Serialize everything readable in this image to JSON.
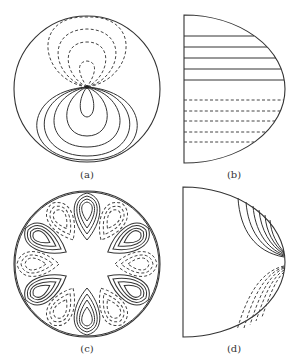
{
  "figure": {
    "panels": [
      {
        "id": "a",
        "caption": "(a)",
        "shape": "full-disk",
        "description": "dipole-like contours: dashed loops above a singular point, solid loops below"
      },
      {
        "id": "b",
        "caption": "(b)",
        "shape": "half-disk",
        "description": "horizontal contour lines: 5 solid in upper half, 5 dashed in lower half"
      },
      {
        "id": "c",
        "caption": "(c)",
        "shape": "full-disk",
        "description": "12 alternating teardrop lobes near the boundary: 6 solid, 6 dashed"
      },
      {
        "id": "d",
        "caption": "(d)",
        "shape": "half-disk",
        "description": "solid curves in upper-right corner, dashed curves in lower-right corner, converging at the equator on the arc"
      }
    ],
    "line_styles": {
      "positive": "solid",
      "negative": "dashed"
    },
    "colors": {
      "stroke": "#333333",
      "background": "#ffffff"
    }
  }
}
